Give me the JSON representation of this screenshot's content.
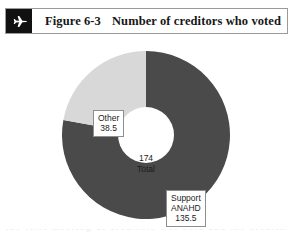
{
  "header": {
    "icon": "airplane-icon",
    "figure_number": "Figure 6-3",
    "caption": "Number of creditors who voted",
    "icon_bg_color": "#111111",
    "border_color": "#9a9a9a"
  },
  "chart_data": {
    "type": "pie",
    "title": "Number of creditors who voted",
    "variant": "donut",
    "center_value": "174",
    "center_label": "Total",
    "total": 174,
    "categories": [
      "Support ANAHD",
      "Other"
    ],
    "values": [
      135.5,
      38.5
    ],
    "percentages": [
      77.9,
      22.1
    ],
    "colors": [
      "#4a4a4a",
      "#d8d8d8"
    ],
    "start_angle_deg": 0,
    "direction": "clockwise",
    "legend": "none",
    "grid": false,
    "xlabel": "",
    "ylabel": "",
    "slices": [
      {
        "name": "Support ANAHD",
        "value": 135.5,
        "percent": 77.9,
        "color": "#4a4a4a",
        "label_lines": [
          "Support",
          "ANAHD",
          "135.5"
        ]
      },
      {
        "name": "Other",
        "value": 38.5,
        "percent": 22.1,
        "color": "#d8d8d8",
        "label_lines": [
          "Other",
          "38.5"
        ]
      }
    ]
  },
  "labels": {
    "other_line1": "Other",
    "other_line2": "38.5",
    "support_line1": "Support",
    "support_line2": "ANAHD",
    "support_line3": "135.5",
    "center_value": "174",
    "center_caption": "Total"
  },
  "page_bottom": {
    "cutoff_text": "the first meeting of creditors was held and the creditors voted"
  }
}
